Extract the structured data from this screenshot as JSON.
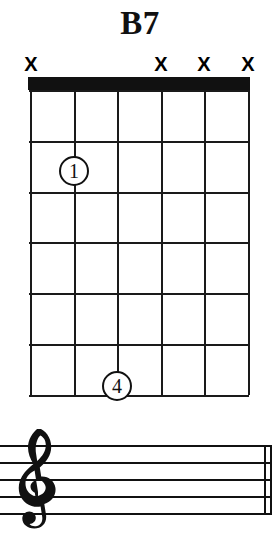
{
  "chord": {
    "name": "B7",
    "instrument": "guitar",
    "string_count": 6,
    "fret_count": 6,
    "starting_fret": 1,
    "nut_shown": true,
    "string_markers": [
      {
        "string": 1,
        "symbol": "X",
        "meaning": "muted",
        "x": 31
      },
      {
        "string": 2,
        "symbol": "",
        "meaning": "fretted",
        "x": 74
      },
      {
        "string": 3,
        "symbol": "",
        "meaning": "fretted",
        "x": 117
      },
      {
        "string": 4,
        "symbol": "X",
        "meaning": "muted",
        "x": 161
      },
      {
        "string": 5,
        "symbol": "X",
        "meaning": "muted",
        "x": 204
      },
      {
        "string": 6,
        "symbol": "X",
        "meaning": "muted",
        "x": 248
      }
    ],
    "finger_positions": [
      {
        "label": "1",
        "string": 2,
        "fret": 2,
        "x": 44,
        "y": 81
      },
      {
        "label": "4",
        "string": 3,
        "fret": 6,
        "x": 87,
        "y": 296
      }
    ],
    "string_x": [
      0,
      43.6,
      87.2,
      130.8,
      174.4,
      218
    ],
    "fret_y": [
      0,
      50.8,
      101.6,
      152.4,
      203.2,
      254,
      305
    ]
  },
  "notation": {
    "clef": "treble-clef",
    "staff_lines": 5,
    "line_y": [
      7,
      24,
      41,
      58,
      75
    ],
    "barline_x": [
      264,
      270
    ],
    "notes": []
  },
  "colors": {
    "ink": "#111111",
    "background": "#ffffff",
    "line": "#1a1a1a"
  }
}
